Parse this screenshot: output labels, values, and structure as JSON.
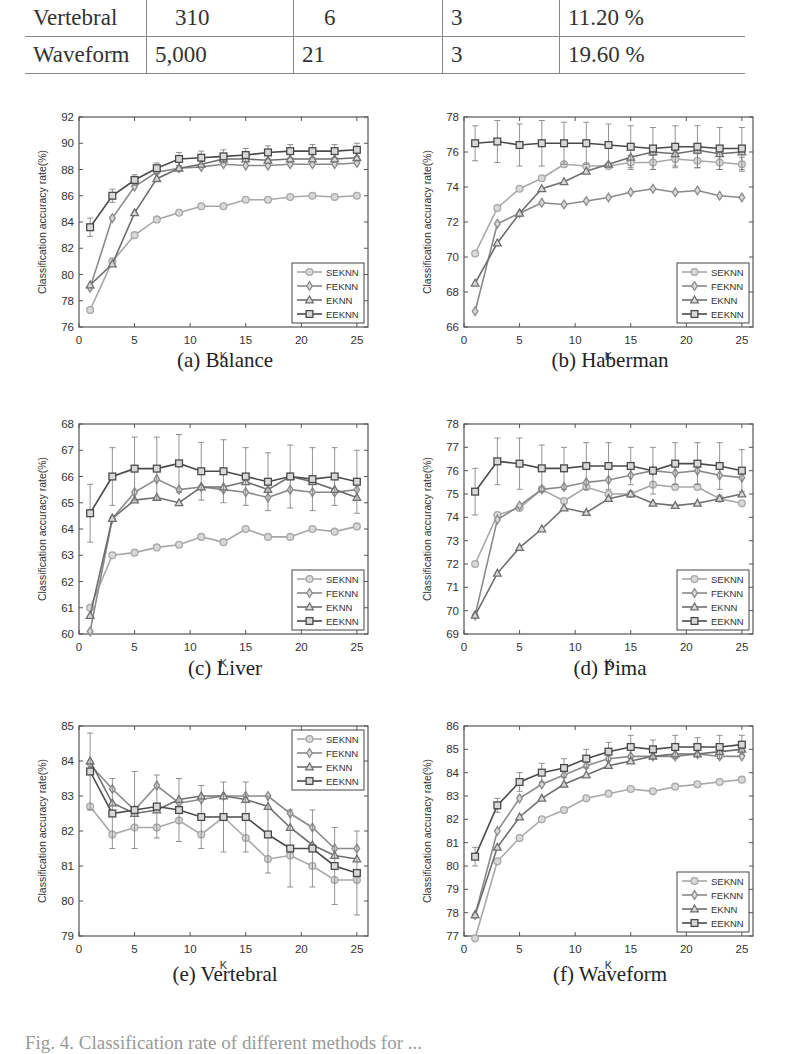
{
  "table": {
    "rows": [
      {
        "dataset": "Vertebral",
        "instances": "310",
        "attributes": "6",
        "classes": "3",
        "noise": "11.20 %"
      },
      {
        "dataset": "Waveform",
        "instances": "5,000",
        "attributes": "21",
        "classes": "3",
        "noise": "19.60 %"
      }
    ]
  },
  "colors": {
    "SEKNN": "#a8a8a8",
    "FEKNN": "#8a8a8a",
    "EKNN": "#6e6e6e",
    "EEKNN": "#4a4a4a",
    "axis": "#555555"
  },
  "figure_caption": "Fig. 4. Classification rate of different methods for ...",
  "chart_data": [
    {
      "id": "a",
      "type": "line",
      "title": "(a) Balance",
      "xlabel": "K",
      "ylabel": "Classification accuracy rate(%)",
      "xlim": [
        0,
        26
      ],
      "ylim": [
        76,
        92
      ],
      "xticks": [
        0,
        5,
        10,
        15,
        20,
        25
      ],
      "yticks": [
        76,
        78,
        80,
        82,
        84,
        86,
        88,
        90,
        92
      ],
      "legend_position": "lower right",
      "grid": false,
      "x": [
        1,
        3,
        5,
        7,
        9,
        11,
        13,
        15,
        17,
        19,
        21,
        23,
        25
      ],
      "series": [
        {
          "name": "SEKNN",
          "marker": "circle",
          "values": [
            77.3,
            81.0,
            83.0,
            84.2,
            84.7,
            85.2,
            85.2,
            85.7,
            85.7,
            85.9,
            86.0,
            85.9,
            86.0
          ]
        },
        {
          "name": "FEKNN",
          "marker": "diamond",
          "values": [
            79.0,
            84.3,
            86.7,
            87.8,
            88.1,
            88.2,
            88.4,
            88.3,
            88.3,
            88.4,
            88.4,
            88.4,
            88.5
          ]
        },
        {
          "name": "EKNN",
          "marker": "triangle",
          "values": [
            79.2,
            80.8,
            84.7,
            87.3,
            88.1,
            88.4,
            88.8,
            88.8,
            88.7,
            88.8,
            88.8,
            88.8,
            88.9
          ]
        },
        {
          "name": "EEKNN",
          "marker": "square",
          "values": [
            83.6,
            86.0,
            87.2,
            88.1,
            88.8,
            88.9,
            89.0,
            89.1,
            89.3,
            89.4,
            89.4,
            89.4,
            89.5
          ],
          "err": [
            0.7,
            0.5,
            0.4,
            0.4,
            0.5,
            0.5,
            0.5,
            0.5,
            0.5,
            0.5,
            0.5,
            0.5,
            0.5
          ]
        }
      ]
    },
    {
      "id": "b",
      "type": "line",
      "title": "(b) Haberman",
      "xlabel": "K",
      "ylabel": "Classification accuracy rate(%)",
      "xlim": [
        0,
        26
      ],
      "ylim": [
        66,
        78
      ],
      "xticks": [
        0,
        5,
        10,
        15,
        20,
        25
      ],
      "yticks": [
        66,
        68,
        70,
        72,
        74,
        76,
        78
      ],
      "legend_position": "lower right",
      "grid": false,
      "x": [
        1,
        3,
        5,
        7,
        9,
        11,
        13,
        15,
        17,
        19,
        21,
        23,
        25
      ],
      "series": [
        {
          "name": "SEKNN",
          "marker": "circle",
          "values": [
            70.2,
            72.8,
            73.9,
            74.5,
            75.3,
            75.2,
            75.2,
            75.4,
            75.4,
            75.6,
            75.5,
            75.4,
            75.3
          ],
          "err": [
            0,
            0,
            0,
            0,
            0,
            0,
            0,
            0.4,
            0.4,
            0.4,
            0.4,
            0.4,
            0.4
          ]
        },
        {
          "name": "FEKNN",
          "marker": "diamond",
          "values": [
            66.9,
            71.9,
            72.5,
            73.1,
            73.0,
            73.2,
            73.4,
            73.7,
            73.9,
            73.7,
            73.8,
            73.5,
            73.4
          ]
        },
        {
          "name": "EKNN",
          "marker": "triangle",
          "values": [
            68.5,
            70.8,
            72.5,
            73.9,
            74.3,
            74.9,
            75.3,
            75.7,
            76.0,
            75.9,
            76.1,
            75.9,
            76.0
          ]
        },
        {
          "name": "EEKNN",
          "marker": "square",
          "values": [
            76.5,
            76.6,
            76.4,
            76.5,
            76.5,
            76.5,
            76.4,
            76.3,
            76.2,
            76.3,
            76.3,
            76.2,
            76.2
          ],
          "err": [
            1.0,
            1.2,
            1.2,
            1.3,
            1.2,
            1.2,
            1.2,
            1.2,
            1.2,
            1.2,
            1.2,
            1.2,
            1.2
          ]
        }
      ]
    },
    {
      "id": "c",
      "type": "line",
      "title": "(c) Liver",
      "xlabel": "K",
      "ylabel": "Classification accuracy rate(%)",
      "xlim": [
        0,
        26
      ],
      "ylim": [
        60,
        68
      ],
      "xticks": [
        0,
        5,
        10,
        15,
        20,
        25
      ],
      "yticks": [
        60,
        61,
        62,
        63,
        64,
        65,
        66,
        67,
        68
      ],
      "legend_position": "lower right",
      "grid": false,
      "x": [
        1,
        3,
        5,
        7,
        9,
        11,
        13,
        15,
        17,
        19,
        21,
        23,
        25
      ],
      "series": [
        {
          "name": "SEKNN",
          "marker": "circle",
          "values": [
            61.0,
            63.0,
            63.1,
            63.3,
            63.4,
            63.7,
            63.5,
            64.0,
            63.7,
            63.7,
            64.0,
            63.9,
            64.1
          ]
        },
        {
          "name": "FEKNN",
          "marker": "diamond",
          "values": [
            60.1,
            64.4,
            65.4,
            65.9,
            65.5,
            65.6,
            65.5,
            65.4,
            65.2,
            65.5,
            65.4,
            65.4,
            65.5
          ]
        },
        {
          "name": "EKNN",
          "marker": "triangle",
          "values": [
            60.7,
            64.4,
            65.1,
            65.2,
            65.0,
            65.6,
            65.6,
            65.8,
            65.5,
            66.0,
            65.8,
            65.5,
            65.2
          ]
        },
        {
          "name": "EEKNN",
          "marker": "square",
          "values": [
            64.6,
            66.0,
            66.3,
            66.3,
            66.5,
            66.2,
            66.2,
            66.0,
            65.8,
            66.0,
            65.9,
            66.0,
            65.8
          ],
          "err": [
            1.1,
            1.1,
            1.2,
            1.2,
            1.1,
            1.1,
            1.2,
            1.1,
            1.1,
            1.2,
            1.2,
            1.1,
            1.2
          ]
        }
      ]
    },
    {
      "id": "d",
      "type": "line",
      "title": "(d) Pima",
      "xlabel": "K",
      "ylabel": "Classification accuracy rate(%)",
      "xlim": [
        0,
        26
      ],
      "ylim": [
        69,
        78
      ],
      "xticks": [
        0,
        5,
        10,
        15,
        20,
        25
      ],
      "yticks": [
        69,
        70,
        71,
        72,
        73,
        74,
        75,
        76,
        77,
        78
      ],
      "legend_position": "lower right",
      "grid": false,
      "x": [
        1,
        3,
        5,
        7,
        9,
        11,
        13,
        15,
        17,
        19,
        21,
        23,
        25
      ],
      "series": [
        {
          "name": "SEKNN",
          "marker": "circle",
          "values": [
            72.0,
            74.1,
            74.4,
            75.2,
            74.7,
            75.3,
            75.0,
            75.0,
            75.4,
            75.3,
            75.3,
            74.8,
            74.6
          ]
        },
        {
          "name": "FEKNN",
          "marker": "diamond",
          "values": [
            69.8,
            73.9,
            74.5,
            75.2,
            75.3,
            75.5,
            75.6,
            75.8,
            76.0,
            75.9,
            76.0,
            75.8,
            75.7
          ]
        },
        {
          "name": "EKNN",
          "marker": "triangle",
          "values": [
            69.8,
            71.6,
            72.7,
            73.5,
            74.4,
            74.2,
            74.8,
            75.0,
            74.6,
            74.5,
            74.6,
            74.8,
            75.0
          ]
        },
        {
          "name": "EEKNN",
          "marker": "square",
          "values": [
            75.1,
            76.4,
            76.3,
            76.1,
            76.1,
            76.2,
            76.2,
            76.2,
            76.0,
            76.3,
            76.3,
            76.2,
            76.0
          ],
          "err": [
            1.0,
            1.0,
            1.1,
            1.0,
            0.9,
            1.0,
            1.0,
            0.8,
            1.0,
            0.9,
            0.9,
            1.0,
            0.9
          ]
        }
      ]
    },
    {
      "id": "e",
      "type": "line",
      "title": "(e) Vertebral",
      "xlabel": "K",
      "ylabel": "Classification accuracy rate(%)",
      "xlim": [
        0,
        26
      ],
      "ylim": [
        79,
        85
      ],
      "xticks": [
        0,
        5,
        10,
        15,
        20,
        25
      ],
      "yticks": [
        79,
        80,
        81,
        82,
        83,
        84,
        85
      ],
      "legend_position": "upper right",
      "grid": false,
      "x": [
        1,
        3,
        5,
        7,
        9,
        11,
        13,
        15,
        17,
        19,
        21,
        23,
        25
      ],
      "series": [
        {
          "name": "SEKNN",
          "marker": "circle",
          "values": [
            82.7,
            81.9,
            82.1,
            82.1,
            82.3,
            81.9,
            82.4,
            81.8,
            81.2,
            81.3,
            81.0,
            80.6,
            80.6
          ]
        },
        {
          "name": "FEKNN",
          "marker": "diamond",
          "values": [
            83.9,
            83.2,
            82.6,
            83.3,
            82.8,
            82.9,
            83.0,
            83.0,
            83.0,
            82.5,
            82.1,
            81.5,
            81.5
          ]
        },
        {
          "name": "EKNN",
          "marker": "triangle",
          "values": [
            84.0,
            82.8,
            82.5,
            82.6,
            82.9,
            83.0,
            83.0,
            82.9,
            82.7,
            82.1,
            81.6,
            81.3,
            81.2
          ]
        },
        {
          "name": "EEKNN",
          "marker": "square",
          "values": [
            83.7,
            82.5,
            82.6,
            82.7,
            82.6,
            82.4,
            82.4,
            82.4,
            81.9,
            81.5,
            81.5,
            81.0,
            80.8
          ],
          "err": [
            1.1,
            1.0,
            1.1,
            0.9,
            0.9,
            0.9,
            1.0,
            1.0,
            1.1,
            1.1,
            1.1,
            1.1,
            1.2
          ]
        }
      ]
    },
    {
      "id": "f",
      "type": "line",
      "title": "(f) Waveform",
      "xlabel": "K",
      "ylabel": "Classification accuracy rate(%)",
      "xlim": [
        0,
        26
      ],
      "ylim": [
        77,
        86
      ],
      "xticks": [
        0,
        5,
        10,
        15,
        20,
        25
      ],
      "yticks": [
        77,
        78,
        79,
        80,
        81,
        82,
        83,
        84,
        85,
        86
      ],
      "legend_position": "lower right",
      "grid": false,
      "x": [
        1,
        3,
        5,
        7,
        9,
        11,
        13,
        15,
        17,
        19,
        21,
        23,
        25
      ],
      "series": [
        {
          "name": "SEKNN",
          "marker": "circle",
          "values": [
            76.9,
            80.2,
            81.2,
            82.0,
            82.4,
            82.9,
            83.1,
            83.3,
            83.2,
            83.4,
            83.5,
            83.6,
            83.7
          ]
        },
        {
          "name": "FEKNN",
          "marker": "diamond",
          "values": [
            77.9,
            81.5,
            82.9,
            83.5,
            83.9,
            84.3,
            84.6,
            84.7,
            84.7,
            84.7,
            84.8,
            84.7,
            84.7
          ]
        },
        {
          "name": "EKNN",
          "marker": "triangle",
          "values": [
            77.9,
            80.8,
            82.1,
            82.9,
            83.5,
            83.9,
            84.3,
            84.5,
            84.7,
            84.8,
            84.8,
            84.9,
            85.0
          ]
        },
        {
          "name": "EEKNN",
          "marker": "square",
          "values": [
            80.4,
            82.6,
            83.6,
            84.0,
            84.2,
            84.6,
            84.9,
            85.1,
            85.0,
            85.1,
            85.1,
            85.1,
            85.2
          ],
          "err": [
            0.4,
            0.3,
            0.4,
            0.4,
            0.4,
            0.4,
            0.4,
            0.5,
            0.4,
            0.5,
            0.4,
            0.5,
            0.4
          ]
        }
      ]
    }
  ]
}
